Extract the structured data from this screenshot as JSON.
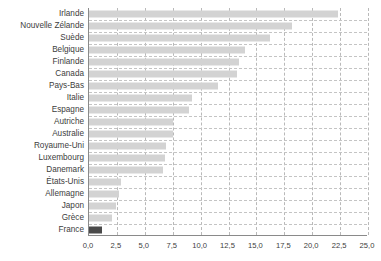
{
  "chart_data": {
    "type": "bar",
    "orientation": "horizontal",
    "title": "",
    "subtitle": "",
    "xlabel": "",
    "ylabel": "",
    "categories": [
      "Irlande",
      "Nouvelle Zélande",
      "Suède",
      "Belgique",
      "Finlande",
      "Canada",
      "Pays-Bas",
      "Italie",
      "Espagne",
      "Autriche",
      "Australie",
      "Royaume-Uni",
      "Luxembourg",
      "Danemark",
      "États-Unis",
      "Allemagne",
      "Japon",
      "Grèce",
      "France"
    ],
    "values": [
      22.3,
      18.2,
      16.2,
      14.0,
      13.4,
      13.3,
      11.6,
      9.2,
      9.0,
      7.5,
      7.5,
      6.9,
      6.8,
      6.6,
      2.9,
      2.65,
      2.4,
      2.1,
      1.2
    ],
    "highlight_category": "France",
    "xlim": [
      0,
      25
    ],
    "xticks": [
      0,
      2.5,
      5,
      7.5,
      10,
      12.5,
      15,
      17.5,
      20,
      22.5,
      25
    ],
    "xtick_labels": [
      "0,0",
      "2,5",
      "5,0",
      "7,5",
      "10,0",
      "12,5",
      "15,0",
      "17,5",
      "20,0",
      "22,5",
      "25,0"
    ],
    "grid": {
      "vertical": true,
      "horizontal": true,
      "style": "dashed"
    },
    "legend": {
      "visible": false
    },
    "colors": {
      "bar": "#d3d3d3",
      "bar_highlight": "#4a4a4a",
      "grid": "#bdbdbd",
      "axis": "#8a8a8a",
      "text": "#3d3d3d",
      "background": "#ffffff"
    }
  }
}
